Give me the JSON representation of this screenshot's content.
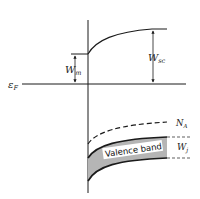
{
  "diagram": {
    "labels": {
      "fermi_level": "ε",
      "fermi_sub": "F",
      "metal_work": "W",
      "metal_work_sub": "m",
      "semiconductor_work": "W",
      "semiconductor_work_sub": "sc",
      "acceptor_level": "N",
      "acceptor_sub": "A",
      "valence_band": "Valence band",
      "band_width": "W",
      "band_width_sub": "j"
    },
    "colors": {
      "line": "#1a1a1a",
      "band_fill": "#b5b5b5"
    }
  }
}
